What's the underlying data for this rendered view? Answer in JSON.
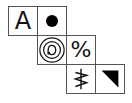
{
  "grid": {
    "cells": [
      {
        "row": 0,
        "col": 0,
        "symbol": "A",
        "name": "letter-a"
      },
      {
        "row": 0,
        "col": 1,
        "symbol": "●",
        "name": "filled-circle-icon"
      },
      {
        "row": 1,
        "col": 1,
        "symbol": "circled-d",
        "name": "circled-symbol-icon"
      },
      {
        "row": 1,
        "col": 2,
        "symbol": "%",
        "name": "percent-sign"
      },
      {
        "row": 2,
        "col": 2,
        "symbol": "zigzag-arrow",
        "name": "zigzag-symbol-icon"
      },
      {
        "row": 2,
        "col": 3,
        "symbol": "◥",
        "name": "black-triangle-icon"
      }
    ]
  }
}
